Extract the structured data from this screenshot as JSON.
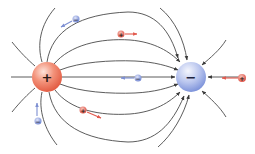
{
  "diagram": {
    "colors": {
      "background": "#ffffff",
      "field_line": "#4a4a4a",
      "positive_charge": "#e8684f",
      "positive_highlight": "#fbd3c8",
      "negative_charge": "#8a9ee0",
      "negative_highlight": "#eef1fb",
      "small_positive": "#e0605a",
      "small_negative": "#7d90d6",
      "positive_velocity_arrow": "#e25a4e",
      "negative_velocity_arrow": "#7d8fd2"
    },
    "main_charges": [
      {
        "id": "source",
        "sign": "+",
        "label": "positive-source-charge",
        "cx": 47,
        "cy": 77,
        "r": 15
      },
      {
        "id": "sink",
        "sign": "−",
        "label": "negative-sink-charge",
        "cx": 191,
        "cy": 77,
        "r": 15
      }
    ],
    "test_charges": [
      {
        "sign": "−",
        "cx": 76,
        "cy": 19,
        "r": 3.5,
        "arrow": {
          "x1": 72,
          "y1": 21,
          "x2": 61,
          "y2": 27
        }
      },
      {
        "sign": "+",
        "cx": 121,
        "cy": 34,
        "r": 3.5,
        "arrow": {
          "x1": 125,
          "y1": 34,
          "x2": 137,
          "y2": 34
        }
      },
      {
        "sign": "−",
        "cx": 138,
        "cy": 78,
        "r": 3.5,
        "arrow": {
          "x1": 134,
          "y1": 78,
          "x2": 121,
          "y2": 78
        }
      },
      {
        "sign": "+",
        "cx": 242,
        "cy": 78,
        "r": 4,
        "arrow": {
          "x1": 238,
          "y1": 78,
          "x2": 222,
          "y2": 78
        }
      },
      {
        "sign": "+",
        "cx": 83,
        "cy": 110,
        "r": 3.5,
        "arrow": {
          "x1": 87,
          "y1": 112,
          "x2": 101,
          "y2": 118
        }
      },
      {
        "sign": "−",
        "cx": 38,
        "cy": 121,
        "r": 3.5,
        "arrow": {
          "x1": 37,
          "y1": 116,
          "x2": 37,
          "y2": 103
        }
      }
    ]
  }
}
